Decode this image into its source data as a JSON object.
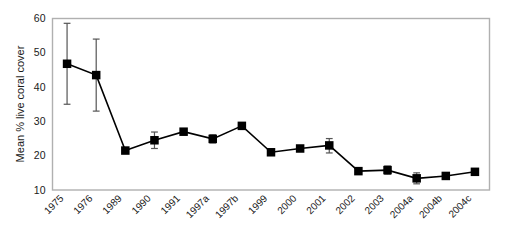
{
  "chart_data": {
    "type": "line",
    "title": "",
    "xlabel": "",
    "ylabel": "Mean % live coral cover",
    "ylim": [
      10,
      60
    ],
    "yticks": [
      10,
      20,
      30,
      40,
      50,
      60
    ],
    "grid": false,
    "legend": null,
    "marker": "filled-square",
    "error_bars": true,
    "categories": [
      "1975",
      "1976",
      "1989",
      "1990",
      "1991",
      "1997a",
      "1997b",
      "1999",
      "2000",
      "2001",
      "2002",
      "2003",
      "2004a",
      "2004b",
      "2004c"
    ],
    "series": [
      {
        "name": "Mean % live coral cover",
        "values": [
          46.8,
          43.5,
          21.5,
          24.5,
          27.0,
          24.9,
          28.7,
          21.0,
          22.1,
          23.0,
          15.5,
          15.8,
          13.4,
          14.1,
          15.3
        ],
        "err_upper": [
          11.8,
          10.5,
          0.0,
          2.4,
          0.0,
          1.2,
          0.0,
          0.0,
          0.0,
          2.0,
          0.0,
          1.2,
          1.6,
          0.0,
          0.0
        ],
        "err_lower": [
          11.8,
          10.5,
          0.0,
          2.4,
          0.0,
          1.2,
          0.0,
          0.0,
          0.0,
          2.2,
          0.0,
          1.2,
          1.6,
          0.0,
          0.0
        ]
      }
    ],
    "colors": {
      "line": "#000000",
      "marker": "#000000",
      "error_bar": "#555555",
      "frame": "#b0b0b0",
      "background": "#ffffff"
    }
  },
  "axes": {
    "y_axis_title": "Mean % live coral cover",
    "y_tick_labels": [
      "60",
      "50",
      "40",
      "30",
      "20",
      "10"
    ],
    "x_tick_labels": [
      "1975",
      "1976",
      "1989",
      "1990",
      "1991",
      "1997a",
      "1997b",
      "1999",
      "2000",
      "2001",
      "2002",
      "2003",
      "2004a",
      "2004b",
      "2004c"
    ]
  }
}
